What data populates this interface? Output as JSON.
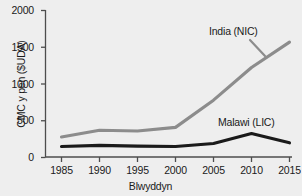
{
  "chart_data": {
    "type": "line",
    "title": "",
    "xlabel": "Blwyddyn",
    "ylabel": "CMC y pen ($UDA)",
    "x": [
      1985,
      1990,
      1995,
      2000,
      2005,
      2010,
      2015
    ],
    "xtick_labels": [
      "1985",
      "1990",
      "1995",
      "2000",
      "2005",
      "2010",
      "2015"
    ],
    "ytick_labels": [
      "0",
      "500",
      "1000",
      "1500",
      "2000"
    ],
    "ytick_values": [
      0,
      500,
      1000,
      1500,
      2000
    ],
    "xlim": [
      1985,
      2015
    ],
    "ylim": [
      0,
      2000
    ],
    "grid": false,
    "legend_position": "inline-annotations",
    "series": [
      {
        "name": "India (NIC)",
        "color": "#8c8c8c",
        "values": [
          280,
          370,
          360,
          410,
          780,
          1225,
          1570
        ]
      },
      {
        "name": "Malawi (LIC)",
        "color": "#1a1a1a",
        "values": [
          150,
          165,
          155,
          150,
          190,
          325,
          200
        ]
      }
    ],
    "annotations": [
      {
        "text": "India (NIC)",
        "series": "India (NIC)"
      },
      {
        "text": "Malawi (LIC)",
        "series": "Malawi (LIC)"
      }
    ]
  },
  "axes": {
    "y_ticks": [
      {
        "label": "2000"
      },
      {
        "label": "1500"
      },
      {
        "label": "1000"
      },
      {
        "label": "500"
      },
      {
        "label": "0"
      }
    ],
    "x_ticks": [
      {
        "label": "1985"
      },
      {
        "label": "1990"
      },
      {
        "label": "1995"
      },
      {
        "label": "2000"
      },
      {
        "label": "2005"
      },
      {
        "label": "2010"
      },
      {
        "label": "2015"
      }
    ]
  },
  "colors": {
    "background": "#eeeeee",
    "axis": "#4d4d4d",
    "text": "#1a1a1a",
    "india_line": "#8c8c8c",
    "malawi_line": "#1a1a1a"
  }
}
